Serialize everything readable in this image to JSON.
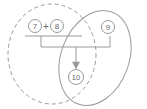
{
  "diagram": {
    "type": "venn-operation-diagram",
    "background_color": "#ffffff",
    "stroke_color": "#9a9a9a",
    "text_color": "#6b6b6b",
    "sets": [
      {
        "name": "left-set",
        "style": "dashed",
        "cx": 52,
        "cy": 54,
        "rx": 44,
        "ry": 50,
        "rotate": 0
      },
      {
        "name": "right-set",
        "style": "solid",
        "cx": 95,
        "cy": 58,
        "rx": 34,
        "ry": 49,
        "rotate": 20
      }
    ],
    "nodes": [
      {
        "name": "node-7",
        "label": "7",
        "cx": 35,
        "cy": 26,
        "r": 6.5
      },
      {
        "name": "node-8",
        "label": "8",
        "cx": 57,
        "cy": 26,
        "r": 6.5
      },
      {
        "name": "node-9",
        "label": "9",
        "cx": 108,
        "cy": 27,
        "r": 6.5
      },
      {
        "name": "node-10",
        "label": "10",
        "cx": 76,
        "cy": 77,
        "r": 7.5
      }
    ],
    "operator": {
      "name": "plus-operator",
      "label": "+",
      "cx": 46,
      "cy": 26
    },
    "underline": {
      "name": "operand-underline",
      "x1": 25,
      "x2": 82,
      "y": 36
    },
    "bracket": {
      "name": "combine-bracket",
      "left_x": 41,
      "right_x": 110,
      "top_left_y": 36,
      "top_right_y": 36,
      "bottom_y": 47
    },
    "arrow": {
      "name": "result-arrow",
      "x": 76,
      "y1": 47,
      "y2": 67,
      "direction": "down"
    }
  }
}
